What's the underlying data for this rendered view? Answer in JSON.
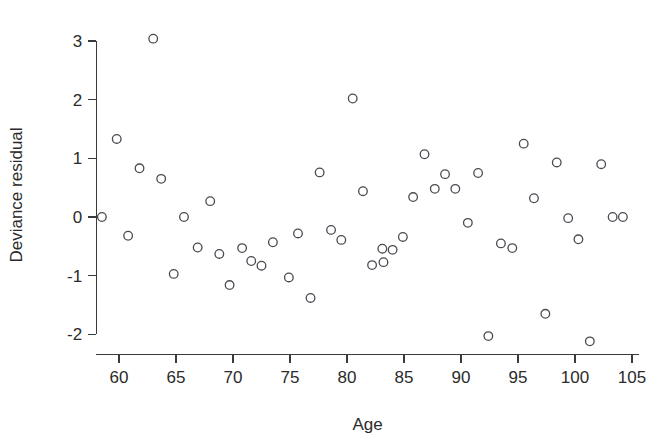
{
  "chart_data": {
    "type": "scatter",
    "title": "",
    "xlabel": "Age",
    "ylabel": "Deviance residual",
    "xlim": [
      58,
      105.6
    ],
    "ylim": [
      -2.35,
      3.25
    ],
    "xticks": [
      60,
      65,
      70,
      75,
      80,
      85,
      90,
      95,
      100,
      105
    ],
    "yticks": [
      -2,
      -1,
      0,
      1,
      2,
      3
    ],
    "xtick_labels": [
      "60",
      "65",
      "70",
      "75",
      "80",
      "85",
      "90",
      "95",
      "100",
      "105"
    ],
    "ytick_labels": [
      "-2",
      "-1",
      "0",
      "1",
      "2",
      "3"
    ],
    "grid": false,
    "legend": "none",
    "marker": "open-circle",
    "marker_color": "#4a4a52",
    "points": [
      {
        "x": 58.5,
        "y": 0.0
      },
      {
        "x": 59.8,
        "y": 1.33
      },
      {
        "x": 60.8,
        "y": -0.32
      },
      {
        "x": 61.8,
        "y": 0.83
      },
      {
        "x": 63.0,
        "y": 3.04
      },
      {
        "x": 63.7,
        "y": 0.65
      },
      {
        "x": 64.8,
        "y": -0.97
      },
      {
        "x": 65.7,
        "y": 0.0
      },
      {
        "x": 66.9,
        "y": -0.52
      },
      {
        "x": 68.0,
        "y": 0.27
      },
      {
        "x": 68.8,
        "y": -0.63
      },
      {
        "x": 69.7,
        "y": -1.16
      },
      {
        "x": 70.8,
        "y": -0.53
      },
      {
        "x": 71.6,
        "y": -0.75
      },
      {
        "x": 72.5,
        "y": -0.83
      },
      {
        "x": 73.5,
        "y": -0.43
      },
      {
        "x": 74.9,
        "y": -1.03
      },
      {
        "x": 75.7,
        "y": -0.28
      },
      {
        "x": 76.8,
        "y": -1.38
      },
      {
        "x": 77.6,
        "y": 0.76
      },
      {
        "x": 78.6,
        "y": -0.22
      },
      {
        "x": 79.5,
        "y": -0.39
      },
      {
        "x": 80.5,
        "y": 2.02
      },
      {
        "x": 81.4,
        "y": 0.44
      },
      {
        "x": 82.2,
        "y": -0.82
      },
      {
        "x": 83.1,
        "y": -0.54
      },
      {
        "x": 83.2,
        "y": -0.77
      },
      {
        "x": 84.0,
        "y": -0.56
      },
      {
        "x": 84.9,
        "y": -0.34
      },
      {
        "x": 85.8,
        "y": 0.34
      },
      {
        "x": 86.8,
        "y": 1.07
      },
      {
        "x": 87.7,
        "y": 0.48
      },
      {
        "x": 88.6,
        "y": 0.73
      },
      {
        "x": 89.5,
        "y": 0.48
      },
      {
        "x": 90.6,
        "y": -0.1
      },
      {
        "x": 91.5,
        "y": 0.75
      },
      {
        "x": 92.4,
        "y": -2.03
      },
      {
        "x": 93.5,
        "y": -0.45
      },
      {
        "x": 94.5,
        "y": -0.53
      },
      {
        "x": 95.5,
        "y": 1.25
      },
      {
        "x": 96.4,
        "y": 0.32
      },
      {
        "x": 97.4,
        "y": -1.65
      },
      {
        "x": 98.4,
        "y": 0.93
      },
      {
        "x": 99.4,
        "y": -0.02
      },
      {
        "x": 100.3,
        "y": -0.38
      },
      {
        "x": 101.3,
        "y": -2.12
      },
      {
        "x": 102.3,
        "y": 0.9
      },
      {
        "x": 103.3,
        "y": 0.0
      },
      {
        "x": 104.2,
        "y": 0.0
      }
    ]
  },
  "axes": {
    "x_axis_name": "Age",
    "y_axis_name": "Deviance residual"
  }
}
